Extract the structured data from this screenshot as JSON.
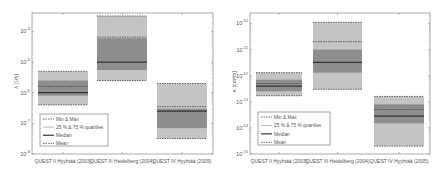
{
  "chart_data": [
    {
      "type": "box",
      "title": "",
      "xlabel": "",
      "ylabel": "λ [1/s]",
      "yscale": "log",
      "ylim": [
        1e-08,
        0.0004
      ],
      "yticks": [
        1e-08,
        1e-07,
        1e-06,
        1e-05,
        0.0001
      ],
      "ytick_labels": [
        "10^-8",
        "10^-7",
        "10^-6",
        "10^-5",
        "10^-4"
      ],
      "categories": [
        "QUEST II Hyyhtää (2003)",
        "QUEST III Heidelberg (2004)",
        "QUEST IV Hyyhtää (2005)"
      ],
      "series": [
        {
          "name": "Min",
          "values": [
            4e-07,
            2.5e-06,
            3.2e-08
          ]
        },
        {
          "name": "25 % quartile",
          "values": [
            8e-07,
            5.5e-06,
            7e-08
          ]
        },
        {
          "name": "Median",
          "values": [
            1e-06,
            1e-05,
            2.5e-07
          ]
        },
        {
          "name": "Mean",
          "values": [
            1.6e-06,
            6.5e-05,
            3.5e-07
          ]
        },
        {
          "name": "75 % quartile",
          "values": [
            2.5e-06,
            6e-05,
            3e-07
          ]
        },
        {
          "name": "Max",
          "values": [
            5e-06,
            0.00032,
            2e-06
          ]
        }
      ],
      "legend": [
        "Min & Max",
        "25 % & 75 % quartiles",
        "Median",
        "Mean"
      ],
      "legend_position": "lower left",
      "grid": false
    },
    {
      "type": "box",
      "title": "",
      "xlabel": "",
      "ylabel": "κ [cm²/s]",
      "yscale": "log",
      "ylim": [
        1e-15,
        2.5e-10
      ],
      "yticks": [
        1e-15,
        1e-14,
        1e-13,
        1e-12,
        1e-11,
        1e-10
      ],
      "ytick_labels": [
        "10^-15",
        "10^-14",
        "10^-13",
        "10^-12",
        "10^-11",
        "10^-10"
      ],
      "categories": [
        "QUEST II Hyyhtää (2003)",
        "QUEST III Heidelberg (2004)",
        "QUEST IV Hyyhtää (2005)"
      ],
      "series": [
        {
          "name": "Min",
          "values": [
            1.7e-13,
            3e-13,
            2e-15
          ]
        },
        {
          "name": "25 % quartile",
          "values": [
            2.5e-13,
            1.3e-12,
            1.5e-14
          ]
        },
        {
          "name": "Median",
          "values": [
            4e-13,
            3.2e-12,
            2.8e-14
          ]
        },
        {
          "name": "Mean",
          "values": [
            5e-13,
            2e-11,
            5e-14
          ]
        },
        {
          "name": "75 % quartile",
          "values": [
            7e-13,
            1e-11,
            8e-14
          ]
        },
        {
          "name": "Max",
          "values": [
            1.3e-12,
            1.1e-10,
            1.6e-13
          ]
        }
      ],
      "legend": [
        "Min & Max",
        "25 % & 75 % quartiles",
        "Median",
        "Mean"
      ],
      "legend_position": "lower left",
      "grid": false
    }
  ],
  "colors": {
    "outer_box": "#c4c4c4",
    "inner_box": "#8e8e8e",
    "median": "#333333",
    "dashed": "#444444",
    "axis": "#888888"
  },
  "panels": [
    {
      "plot": {
        "left": 32,
        "right": 213,
        "top": 13,
        "bottom": 154
      },
      "boxes_x": [
        [
          38,
          88
        ],
        [
          97,
          147
        ],
        [
          157,
          207
        ]
      ],
      "legend_box": {
        "x": 40,
        "y": 114,
        "w": 68,
        "h": 32
      }
    },
    {
      "plot": {
        "left": 250,
        "right": 430,
        "top": 13,
        "bottom": 154
      },
      "boxes_x": [
        [
          256,
          302
        ],
        [
          313,
          362
        ],
        [
          374,
          424
        ]
      ],
      "legend_box": {
        "x": 258,
        "y": 112,
        "w": 72,
        "h": 33
      }
    }
  ]
}
